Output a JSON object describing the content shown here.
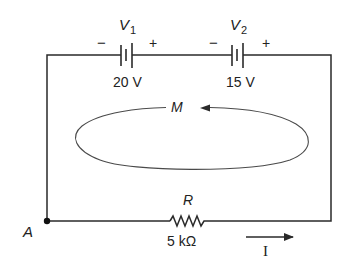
{
  "diagram": {
    "type": "series-circuit",
    "batteries": [
      {
        "name": "V",
        "subscript": "1",
        "voltage": "20 V",
        "minus": "−",
        "plus": "+"
      },
      {
        "name": "V",
        "subscript": "2",
        "voltage": "15 V",
        "minus": "−",
        "plus": "+"
      }
    ],
    "resistor": {
      "name": "R",
      "value": "5 kΩ"
    },
    "node": {
      "label": "A"
    },
    "loop": {
      "label": "M",
      "direction": "counterclockwise"
    },
    "current": {
      "label": "I",
      "direction": "right"
    },
    "colors": {
      "wire": "#2a2a2a",
      "loop": "#4a4a4a",
      "background": "#ffffff"
    }
  }
}
